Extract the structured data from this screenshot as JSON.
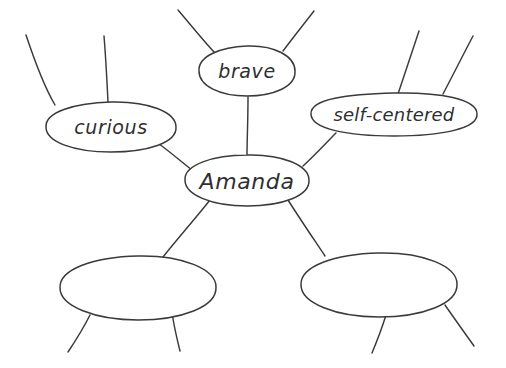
{
  "diagram": {
    "kind": "hand-drawn mind map",
    "ink_color": "#3a3a3a",
    "background_color": "#ffffff",
    "center": {
      "id": "amanda",
      "label": "Amanda",
      "cx": 247,
      "cy": 180,
      "rx": 62,
      "ry": 25
    },
    "branches": [
      {
        "id": "curious",
        "label": "curious",
        "cx": 111,
        "cy": 127,
        "rx": 65,
        "ry": 25,
        "spokes": 2
      },
      {
        "id": "brave",
        "label": "brave",
        "cx": 247,
        "cy": 71,
        "rx": 48,
        "ry": 25,
        "spokes": 2
      },
      {
        "id": "self-centered",
        "label": "self-centered",
        "cx": 394,
        "cy": 114,
        "rx": 83,
        "ry": 21,
        "spokes": 2
      },
      {
        "id": "blank-left",
        "label": "",
        "cx": 138,
        "cy": 288,
        "rx": 78,
        "ry": 32,
        "spokes": 2
      },
      {
        "id": "blank-right",
        "label": "",
        "cx": 379,
        "cy": 285,
        "rx": 78,
        "ry": 32,
        "spokes": 2
      }
    ]
  }
}
